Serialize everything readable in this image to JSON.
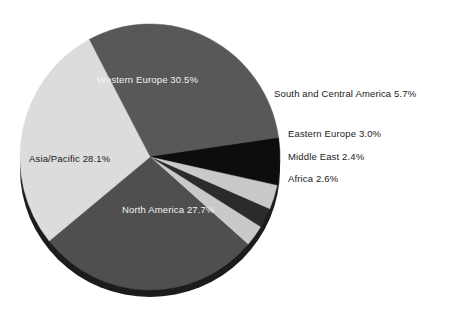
{
  "chart_data": {
    "type": "pie",
    "title": "",
    "subtitle": "",
    "xlabel": "",
    "ylabel": "",
    "legend_position": "none",
    "grid": false,
    "units": "percent",
    "categories": [
      "Western Europe",
      "South and Central America",
      "Eastern Europe",
      "Middle East",
      "Africa",
      "North America",
      "Asia/Pacific"
    ],
    "values": [
      30.5,
      5.7,
      3.0,
      2.4,
      2.6,
      27.7,
      28.1
    ],
    "slices": [
      {
        "label": "Western Europe",
        "value": 30.5,
        "value_text": "30.5%",
        "full_text": "Western Europe 30.5%",
        "color": "#585858",
        "label_placement": "inside",
        "label_color": "#f2f2f2"
      },
      {
        "label": "South and Central America",
        "value": 5.7,
        "value_text": "5.7%",
        "full_text": "South and Central America 5.7%",
        "color": "#0d0d0d",
        "label_placement": "outside",
        "label_color": "#1a1a1a"
      },
      {
        "label": "Eastern Europe",
        "value": 3.0,
        "value_text": "3.0%",
        "full_text": "Eastern Europe 3.0%",
        "color": "#c9c9c9",
        "label_placement": "outside",
        "label_color": "#1a1a1a"
      },
      {
        "label": "Middle East",
        "value": 2.4,
        "value_text": "2.4%",
        "full_text": "Middle East 2.4%",
        "color": "#2b2b2b",
        "label_placement": "outside",
        "label_color": "#1a1a1a"
      },
      {
        "label": "Africa",
        "value": 2.6,
        "value_text": "2.6%",
        "full_text": "Africa 2.6%",
        "color": "#c9c9c9",
        "label_placement": "outside",
        "label_color": "#1a1a1a"
      },
      {
        "label": "North America",
        "value": 27.7,
        "value_text": "27.7%",
        "full_text": "North America 27.7%",
        "color": "#4f4f4f",
        "label_placement": "inside",
        "label_color": "#f2f2f2"
      },
      {
        "label": "Asia/Pacific",
        "value": 28.1,
        "value_text": "28.1%",
        "full_text": "Asia/Pacific 28.1%",
        "color": "#dcdcdc",
        "label_placement": "inside",
        "label_color": "#1a1a1a"
      }
    ],
    "total": 100.0,
    "background_color": "#ffffff",
    "shadow_color": "#1c1c1c"
  }
}
